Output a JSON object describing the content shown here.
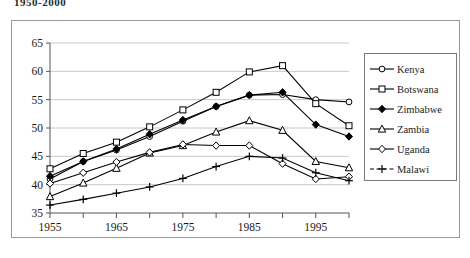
{
  "page_title": "1950-2000",
  "chart_data": {
    "type": "line",
    "title": "",
    "subtitle": "",
    "xlabel": "",
    "ylabel": "",
    "x": [
      1955,
      1960,
      1965,
      1970,
      1975,
      1980,
      1985,
      1990,
      1995,
      2000
    ],
    "xlim": [
      1955,
      2000
    ],
    "ylim": [
      35,
      65
    ],
    "xticks": [
      1955,
      1960,
      1965,
      1970,
      1975,
      1980,
      1985,
      1990,
      1995,
      2000
    ],
    "xtick_labels": [
      "1955",
      "",
      "1965",
      "",
      "1975",
      "",
      "1985",
      "",
      "1995",
      ""
    ],
    "yticks": [
      35,
      40,
      45,
      50,
      55,
      60,
      65
    ],
    "ytick_labels": [
      "35",
      "40",
      "45",
      "50",
      "55",
      "60",
      "65"
    ],
    "grid": true,
    "legend_position": "right",
    "series": [
      {
        "name": "Kenya",
        "marker": "open-circle",
        "values": [
          41.0,
          44.1,
          46.1,
          48.5,
          51.2,
          53.8,
          55.8,
          55.9,
          55.0,
          54.6
        ]
      },
      {
        "name": "Botswana",
        "marker": "open-square",
        "values": [
          42.8,
          45.5,
          47.5,
          50.2,
          53.2,
          56.3,
          59.9,
          61.0,
          54.3,
          50.4
        ]
      },
      {
        "name": "Zimbabwe",
        "marker": "filled-diamond",
        "values": [
          41.5,
          44.1,
          46.3,
          48.9,
          51.4,
          53.8,
          55.8,
          56.3,
          50.6,
          48.5
        ]
      },
      {
        "name": "Zambia",
        "marker": "open-triangle",
        "values": [
          37.9,
          40.3,
          42.9,
          45.6,
          46.9,
          49.3,
          51.3,
          49.6,
          44.1,
          43.0
        ]
      },
      {
        "name": "Uganda",
        "marker": "open-diamond",
        "values": [
          40.2,
          42.1,
          44.0,
          45.7,
          47.1,
          46.9,
          46.9,
          43.7,
          41.0,
          41.4
        ]
      },
      {
        "name": "Malawi",
        "marker": "plus",
        "values": [
          36.4,
          37.4,
          38.5,
          39.6,
          41.1,
          43.2,
          45.0,
          44.7,
          42.1,
          40.7
        ]
      }
    ]
  },
  "colors": {
    "line": "#000000",
    "grid": "#c8c8c8",
    "axis": "#555555",
    "frame": "#9a9a9a",
    "legend_border": "#7a7a7a",
    "marker_fill_open": "#ffffff",
    "marker_fill_solid": "#000000"
  }
}
